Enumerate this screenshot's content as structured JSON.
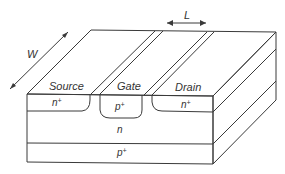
{
  "diagram": {
    "type": "3D cross-section of JFET (junction field-effect transistor) structure",
    "dimensions": {
      "width_label": "W",
      "length_label": "L"
    },
    "terminals": {
      "source": "Source",
      "gate": "Gate",
      "drain": "Drain"
    },
    "regions": {
      "source_doping": {
        "base": "n",
        "sup": "+"
      },
      "gate_doping": {
        "base": "p",
        "sup": "+"
      },
      "drain_doping": {
        "base": "n",
        "sup": "+"
      },
      "channel": {
        "base": "n"
      },
      "substrate": {
        "base": "p",
        "sup": "+"
      }
    },
    "colors": {
      "line": "#3a3a3a",
      "text": "#333333",
      "background": "#ffffff"
    }
  }
}
